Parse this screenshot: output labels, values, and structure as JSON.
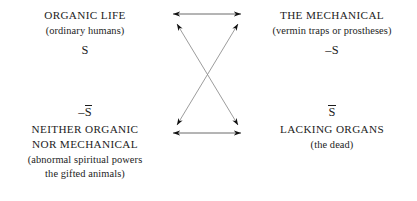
{
  "diagram": {
    "type": "semiotic-square",
    "width": 417,
    "height": 201,
    "background_color": "#ffffff",
    "ink_color": "#1c1c1c",
    "quadrants": {
      "top_left": {
        "heading": "ORGANIC LIFE",
        "gloss": "(ordinary humans)",
        "symbol_prefix": "",
        "symbol_letter": "S",
        "symbol_overline": false,
        "symbol_position": "below"
      },
      "top_right": {
        "heading": "THE MECHANICAL",
        "gloss": "(vermin traps or prostheses)",
        "symbol_prefix": "–",
        "symbol_letter": "S",
        "symbol_overline": false,
        "symbol_position": "below"
      },
      "bottom_left": {
        "heading_line_1": "NEITHER ORGANIC",
        "heading_line_2": "NOR MECHANICAL",
        "gloss_line_1": "(abnormal spiritual powers",
        "gloss_line_2": "the gifted animals)",
        "symbol_prefix": "–",
        "symbol_letter": "S",
        "symbol_overline": true,
        "symbol_position": "above"
      },
      "bottom_right": {
        "heading": "LACKING ORGANS",
        "gloss": "(the dead)",
        "symbol_prefix": "",
        "symbol_letter": "S",
        "symbol_overline": true,
        "symbol_position": "above"
      }
    },
    "connectors": [
      {
        "name": "top-horizontal-arrow",
        "kind": "double-headed-straight",
        "from": "top_left",
        "to": "top_right",
        "x1": 173,
        "y1": 14,
        "x2": 241,
        "y2": 14
      },
      {
        "name": "bottom-horizontal-arrow",
        "kind": "double-headed-straight",
        "from": "bottom_left",
        "to": "bottom_right",
        "x1": 173,
        "y1": 133,
        "x2": 241,
        "y2": 133
      },
      {
        "name": "diagonal-arrow-tl-br",
        "kind": "double-headed-straight",
        "from": "top_left",
        "to": "bottom_right",
        "x1": 177,
        "y1": 24,
        "x2": 238,
        "y2": 125
      },
      {
        "name": "diagonal-arrow-tr-bl",
        "kind": "double-headed-straight",
        "from": "top_right",
        "to": "bottom_left",
        "x1": 238,
        "y1": 24,
        "x2": 177,
        "y2": 125
      }
    ]
  }
}
